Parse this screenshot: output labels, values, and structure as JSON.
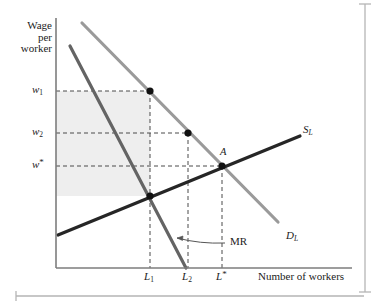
{
  "figure": {
    "type": "economics-diagram",
    "axes": {
      "y_title_lines": [
        "Wage",
        "per",
        "worker"
      ],
      "x_title": "Number of workers",
      "origin": {
        "x": 56,
        "y": 268
      },
      "y_axis_top": 18,
      "x_axis_right": 352
    },
    "y_ticks": [
      {
        "name": "w1",
        "label_html": "w<sub>1</sub>",
        "y": 91
      },
      {
        "name": "w2",
        "label_html": "w<sub>2</sub>",
        "y": 133
      },
      {
        "name": "wstar",
        "label_html": "w<sup>*</sup>",
        "y": 166
      }
    ],
    "x_ticks": [
      {
        "name": "L1",
        "label_html": "L<sub>1</sub>",
        "x": 150
      },
      {
        "name": "L2",
        "label_html": "L<sub>2</sub>",
        "x": 188
      },
      {
        "name": "Lstar",
        "label_html": "L<sup>*</sup>",
        "x": 222
      }
    ],
    "curves": [
      {
        "name": "labor-supply",
        "label_html": "S<sub>L</sub>",
        "label_pos": {
          "x": 303,
          "y": 124
        },
        "color": "#262626",
        "width": 3,
        "points": [
          {
            "x": 58,
            "y": 235
          },
          {
            "x": 300,
            "y": 136
          }
        ]
      },
      {
        "name": "labor-demand",
        "label_html": "D<sub>L</sub>",
        "label_pos": {
          "x": 286,
          "y": 230
        },
        "color": "#9a9a9a",
        "width": 3,
        "points": [
          {
            "x": 82,
            "y": 23
          },
          {
            "x": 278,
            "y": 222
          }
        ]
      },
      {
        "name": "marginal-revenue",
        "label_html": "MR",
        "label_pos": {
          "x": 230,
          "y": 243
        },
        "color": "#646464",
        "width": 3,
        "points": [
          {
            "x": 70,
            "y": 46
          },
          {
            "x": 186,
            "y": 268
          }
        ]
      }
    ],
    "points": [
      {
        "name": "point-w1-L1",
        "x": 150,
        "y": 91,
        "label": ""
      },
      {
        "name": "point-w2-L2",
        "x": 188,
        "y": 133,
        "label": ""
      },
      {
        "name": "point-A",
        "x": 222,
        "y": 166,
        "label": "A",
        "label_pos": {
          "x": 220,
          "y": 146
        }
      },
      {
        "name": "point-mr-supply-intersection",
        "x": 150,
        "y": 196,
        "label": ""
      }
    ],
    "shaded_region": {
      "name": "producer-surplus-area",
      "color": "#eeeeee",
      "x": 56,
      "y": 91,
      "width": 94,
      "height": 105
    },
    "dashed_lines": [
      {
        "name": "w1-horizontal",
        "x1": 56,
        "y1": 91,
        "x2": 150,
        "y2": 91
      },
      {
        "name": "w2-horizontal",
        "x1": 56,
        "y1": 133,
        "x2": 188,
        "y2": 133
      },
      {
        "name": "wstar-horizontal",
        "x1": 56,
        "y1": 166,
        "x2": 222,
        "y2": 166
      },
      {
        "name": "L1-vertical",
        "x1": 150,
        "y1": 91,
        "x2": 150,
        "y2": 268
      },
      {
        "name": "L2-vertical",
        "x1": 188,
        "y1": 133,
        "x2": 188,
        "y2": 268
      },
      {
        "name": "Lstar-vertical",
        "x1": 222,
        "y1": 166,
        "x2": 222,
        "y2": 268
      }
    ],
    "annotation_arrow": {
      "name": "mr-callout-arrow",
      "from": {
        "x": 225,
        "y": 243
      },
      "to": {
        "x": 175,
        "y": 238
      },
      "color": "#555555"
    },
    "frame": {
      "right_rule_x": 365,
      "bottom_rule_y": 293,
      "color": "#b0b0b0"
    }
  }
}
